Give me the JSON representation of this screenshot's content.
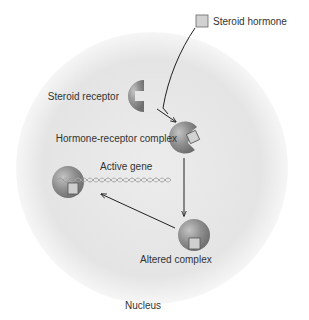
{
  "diagram": {
    "labels": {
      "steroid_hormone": "Steroid hormone",
      "steroid_receptor": "Steroid receptor",
      "hormone_receptor_complex": "Hormone-receptor complex",
      "active_gene": "Active gene",
      "altered_complex": "Altered complex",
      "nucleus": "Nucleus"
    },
    "colors": {
      "nucleus_fill": "#e6e6e6",
      "nucleus_edge": "#f7f7f7",
      "receptor_fill": "#8a8a8a",
      "receptor_highlight": "#bdbdbd",
      "hormone_fill": "#cfcfcf",
      "hormone_stroke": "#555555",
      "arrow": "#222222",
      "text": "#333333"
    },
    "flow": [
      {
        "from": "Steroid hormone",
        "to": "Hormone-receptor complex"
      },
      {
        "from": "Steroid receptor",
        "to": "Hormone-receptor complex"
      },
      {
        "from": "Hormone-receptor complex",
        "to": "Altered complex"
      },
      {
        "from": "Altered complex",
        "to": "Active gene"
      }
    ]
  }
}
